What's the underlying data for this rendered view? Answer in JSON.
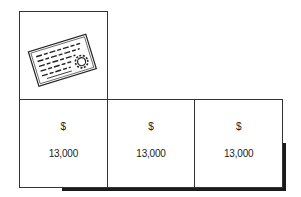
{
  "diagram": {
    "icon": "certificate-icon",
    "cells": [
      {
        "symbol": "$",
        "value": "13,000"
      },
      {
        "symbol": "$",
        "value": "13,000"
      },
      {
        "symbol": "$",
        "value": "13,000"
      }
    ],
    "colors": {
      "border": "#333333",
      "shadow": "#1a1a1a",
      "background": "#ffffff"
    }
  }
}
